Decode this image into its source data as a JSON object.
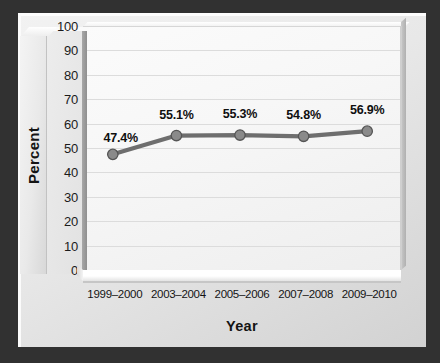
{
  "chart_data": {
    "type": "line",
    "title": "",
    "xlabel": "Year",
    "ylabel": "Percent",
    "categories": [
      "1999–2000",
      "2003–2004",
      "2005–2006",
      "2007–2008",
      "2009–2010"
    ],
    "values": [
      47.4,
      55.1,
      55.3,
      54.8,
      56.9
    ],
    "point_labels": [
      "47.4%",
      "55.1%",
      "55.3%",
      "54.8%",
      "56.9%"
    ],
    "ylim": [
      0,
      100
    ],
    "ytick_labels": [
      "100",
      "90",
      "80",
      "70",
      "60",
      "50",
      "40",
      "30",
      "20",
      "10",
      "0"
    ],
    "ytick_values": [
      100,
      90,
      80,
      70,
      60,
      50,
      40,
      30,
      20,
      10,
      0
    ],
    "grid": true,
    "legend": false,
    "series": [
      {
        "name": "Percent",
        "values": [
          47.4,
          55.1,
          55.3,
          54.8,
          56.9
        ]
      }
    ],
    "style": {
      "line_color": "#6e6e6e",
      "marker_color": "#8a8a8a",
      "marker_edge_color": "#555555",
      "grid_color": "#dcdcdc",
      "plot_background": "#f8f8f8",
      "frame_background": "#e8e8e8",
      "outer_background": "#313131",
      "text_color": "#141414"
    }
  }
}
